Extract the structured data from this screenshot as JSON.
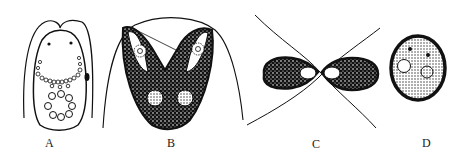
{
  "figure": {
    "panels": [
      {
        "id": "A",
        "label": "A",
        "description": "cell with two flagella, eyespots, ring of granules and nucleus"
      },
      {
        "id": "B",
        "label": "B",
        "description": "V-shaped cell with two lobes, pyrenoids and stippled cytoplasm"
      },
      {
        "id": "C",
        "label": "C",
        "description": "two cells joined in conjugation with crossing flagella"
      },
      {
        "id": "D",
        "label": "D",
        "description": "oval cyst with stippled contents"
      }
    ],
    "colors": {
      "ink": "#111111",
      "background": "#ffffff"
    }
  }
}
